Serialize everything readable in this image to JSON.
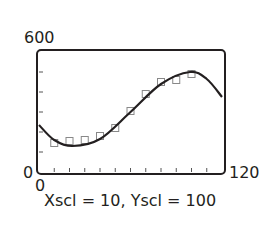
{
  "window": {
    "xmin_label": "0",
    "xmax_label": "120",
    "ymin_label": "0",
    "ymax_label": "600",
    "caption": "Xscl = 10, Yscl = 100"
  },
  "chart_data": {
    "type": "scatter",
    "title": "",
    "xlabel": "",
    "ylabel": "",
    "xlim": [
      0,
      120
    ],
    "ylim": [
      0,
      600
    ],
    "xscl": 10,
    "yscl": 100,
    "grid": false,
    "legend": null,
    "series": [
      {
        "name": "data points",
        "marker": "square",
        "x": [
          10,
          20,
          30,
          40,
          50,
          60,
          70,
          80,
          90,
          100
        ],
        "y": [
          145,
          155,
          160,
          180,
          220,
          305,
          390,
          450,
          460,
          490
        ]
      },
      {
        "name": "cubic regression curve",
        "style": "line",
        "x": [
          0,
          10,
          22,
          40,
          60,
          80,
          99,
          110,
          120
        ],
        "y": [
          235,
          160,
          130,
          165,
          300,
          440,
          500,
          465,
          375
        ]
      }
    ],
    "annotations": [
      "Xscl = 10, Yscl = 100"
    ]
  }
}
